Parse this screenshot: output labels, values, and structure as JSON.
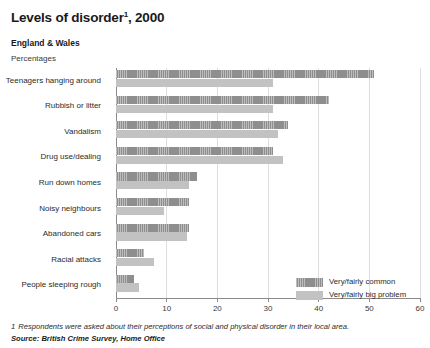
{
  "header": {
    "title": "Levels of disorder",
    "title_footnote_marker": "1",
    "title_year": ", 2000",
    "subtitle": "England & Wales",
    "units": "Percentages"
  },
  "legend": {
    "items": [
      {
        "label": "Very/fairly common",
        "color": "#8e8e8e",
        "key": "common"
      },
      {
        "label": "Very/fairly big problem",
        "color": "#c2c2c2",
        "key": "problem"
      }
    ]
  },
  "footer": {
    "footnote_marker": "1",
    "footnote": "Respondents were asked about their perceptions of social and physical disorder in their local area.",
    "source": "Source: British Crime Survey, Home Office"
  },
  "chart_data": {
    "type": "bar",
    "orientation": "horizontal",
    "subtitle": "England & Wales",
    "xlabel": "Percentages",
    "ylabel": "",
    "xlim": [
      0,
      60
    ],
    "xticks": [
      0,
      10,
      20,
      30,
      40,
      50,
      60
    ],
    "xtick_labels": [
      "0",
      "10",
      "20",
      "30",
      "40",
      "50",
      "60"
    ],
    "grid": true,
    "legend_position": "center-right",
    "categories": [
      "Teenagers hanging around",
      "Rubbish or litter",
      "Vandalism",
      "Drug use/dealing",
      "Run down homes",
      "Noisy neighbours",
      "Abandoned cars",
      "Racial attacks",
      "People sleeping rough"
    ],
    "series": [
      {
        "name": "Very/fairly common",
        "color": "#8e8e8e",
        "values": [
          51,
          42,
          34,
          31,
          16,
          14.5,
          14.5,
          5.5,
          3.5
        ]
      },
      {
        "name": "Very/fairly big problem",
        "color": "#c2c2c2",
        "values": [
          31,
          31,
          32,
          33,
          14.5,
          9.5,
          14,
          7.5,
          4.5
        ]
      }
    ]
  }
}
